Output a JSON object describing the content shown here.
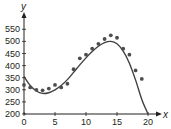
{
  "chart_data": {
    "type": "scatter",
    "title": "",
    "xlabel": "x",
    "ylabel": "y",
    "xlim": [
      0,
      21
    ],
    "ylim": [
      200,
      575
    ],
    "x_ticks": [
      0,
      5,
      10,
      15,
      20
    ],
    "y_ticks": [
      200,
      250,
      300,
      350,
      400,
      450,
      500,
      550
    ],
    "grid": false,
    "legend": null,
    "series": [
      {
        "name": "data points",
        "kind": "scatter",
        "x": [
          0,
          1,
          2,
          3,
          4,
          5,
          6,
          7,
          8,
          9,
          10,
          11,
          12,
          13,
          14,
          15,
          16,
          17,
          18,
          19
        ],
        "y": [
          320,
          310,
          300,
          298,
          305,
          320,
          310,
          325,
          385,
          430,
          445,
          470,
          490,
          510,
          525,
          515,
          470,
          445,
          380,
          345
        ]
      },
      {
        "name": "fitted curve",
        "kind": "line",
        "x": [
          0,
          1,
          2,
          3,
          4,
          5,
          6,
          7,
          8,
          9,
          10,
          11,
          12,
          13,
          14,
          15,
          16,
          17,
          18,
          19,
          20
        ],
        "y": [
          355,
          318,
          295,
          285,
          288,
          300,
          318,
          342,
          372,
          403,
          432,
          458,
          480,
          495,
          500,
          490,
          460,
          410,
          340,
          260,
          200
        ]
      }
    ],
    "colors": {
      "axis": "#231f20",
      "points": "#4d4d4f",
      "curve": "#414042"
    }
  }
}
